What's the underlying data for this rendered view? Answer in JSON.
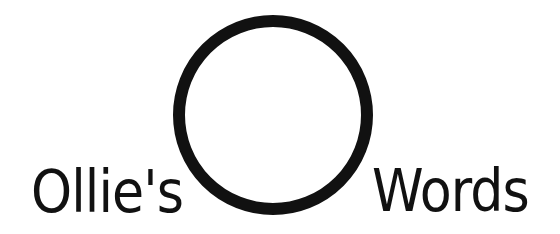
{
  "logo": {
    "left_word": "Ollie's",
    "right_word": "Words",
    "emblem": "circle-ring",
    "colors": {
      "ink": "#111111",
      "background": "#ffffff"
    }
  }
}
